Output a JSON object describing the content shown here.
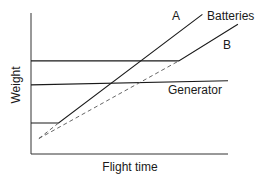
{
  "chart_data": {
    "type": "line",
    "title": "",
    "xlabel": "Flight time",
    "ylabel": "Weight",
    "xlim": [
      0,
      100
    ],
    "ylim": [
      0,
      100
    ],
    "grid": false,
    "ticks": "none",
    "series": [
      {
        "name": "Batteries",
        "label": "Batteries",
        "style": "solid",
        "points": [
          [
            0,
            66
          ],
          [
            75,
            66
          ],
          [
            105,
            92
          ]
        ]
      },
      {
        "name": "Generator",
        "label": "Generator",
        "style": "solid",
        "points": [
          [
            0,
            49
          ],
          [
            100,
            52
          ]
        ]
      },
      {
        "name": "A",
        "label": "A",
        "style": "solid",
        "points": [
          [
            0,
            22
          ],
          [
            14,
            22
          ],
          [
            87,
            99
          ]
        ]
      },
      {
        "name": "B",
        "label": "B",
        "style": "dashed",
        "points": [
          [
            4,
            11
          ],
          [
            75,
            66
          ]
        ]
      },
      {
        "name": "A-extension",
        "label": "",
        "style": "dashed",
        "points": [
          [
            4,
            11
          ],
          [
            14,
            22
          ]
        ]
      }
    ],
    "annotations": [
      "A",
      "B",
      "Batteries",
      "Generator"
    ]
  }
}
